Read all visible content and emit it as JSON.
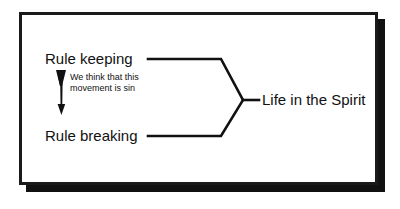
{
  "diagram": {
    "type": "flow-diagram",
    "background_color": "#ffffff",
    "frame": {
      "border_color": "#1a1a1a",
      "fill_color": "#ffffff",
      "shadow_color": "#111111"
    },
    "nodes": [
      {
        "id": "rule-keeping",
        "label": "Rule keeping"
      },
      {
        "id": "rule-breaking",
        "label": "Rule breaking"
      },
      {
        "id": "life-in-the-spirit",
        "label": "Life in the Spirit"
      }
    ],
    "annotation": {
      "line1": "We think that this",
      "line2": "movement is sin",
      "arrow": "down-arrow"
    },
    "connectors": {
      "stroke_color": "#111111",
      "description": "Rule keeping and Rule breaking converge via a brace into Life in the Spirit"
    }
  }
}
